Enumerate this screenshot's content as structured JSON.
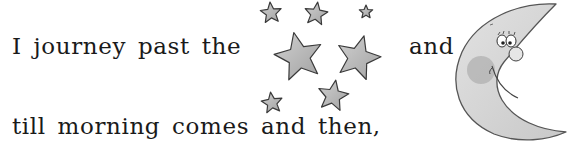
{
  "poem": {
    "line1_start": "I journey past the",
    "line1_end": "and",
    "line2": "till morning comes and then,"
  },
  "illustrations": {
    "stars": {
      "icon": "stars-cluster-icon",
      "fill": "#b8b8b8",
      "stroke": "#3a3a3a",
      "items": [
        {
          "cx": 271,
          "cy": 13,
          "r": 11,
          "rot": -5
        },
        {
          "cx": 316,
          "cy": 14,
          "r": 12,
          "rot": 8
        },
        {
          "cx": 366,
          "cy": 12,
          "r": 7,
          "rot": 0
        },
        {
          "cx": 299,
          "cy": 57,
          "r": 25,
          "rot": -12
        },
        {
          "cx": 358,
          "cy": 58,
          "r": 23,
          "rot": 15
        },
        {
          "cx": 333,
          "cy": 96,
          "r": 16,
          "rot": 10
        },
        {
          "cx": 272,
          "cy": 103,
          "r": 11,
          "rot": -8
        }
      ]
    },
    "moon": {
      "icon": "smiling-crescent-moon-icon",
      "fill": "#d6d6d6",
      "cheek": "#b0b0b0"
    }
  }
}
